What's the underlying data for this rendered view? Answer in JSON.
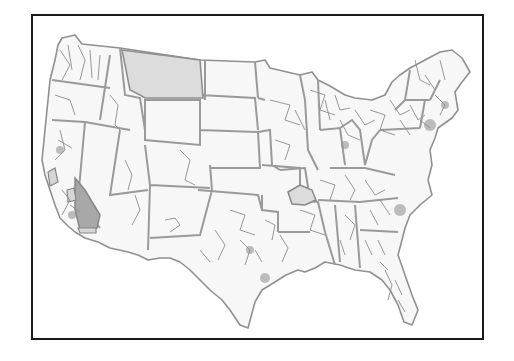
{
  "map": {
    "subject": "Contiguous United States congressional district boundaries",
    "colors": {
      "background": "#ffffff",
      "frame": "#1a1a1a",
      "land_fill": "#f7f7f7",
      "boundary": "#8c8c8c",
      "state_boundary": "#9a9a9a",
      "highlight_light": "#dcdcdc",
      "highlight_dark": "#a8a8a8"
    },
    "highlighted_regions": [
      {
        "name": "montana",
        "shade": "light"
      },
      {
        "name": "southeast-california-district",
        "shade": "dark"
      },
      {
        "name": "central-california-districts",
        "shade": "light"
      },
      {
        "name": "western-kentucky-district",
        "shade": "light"
      }
    ]
  }
}
